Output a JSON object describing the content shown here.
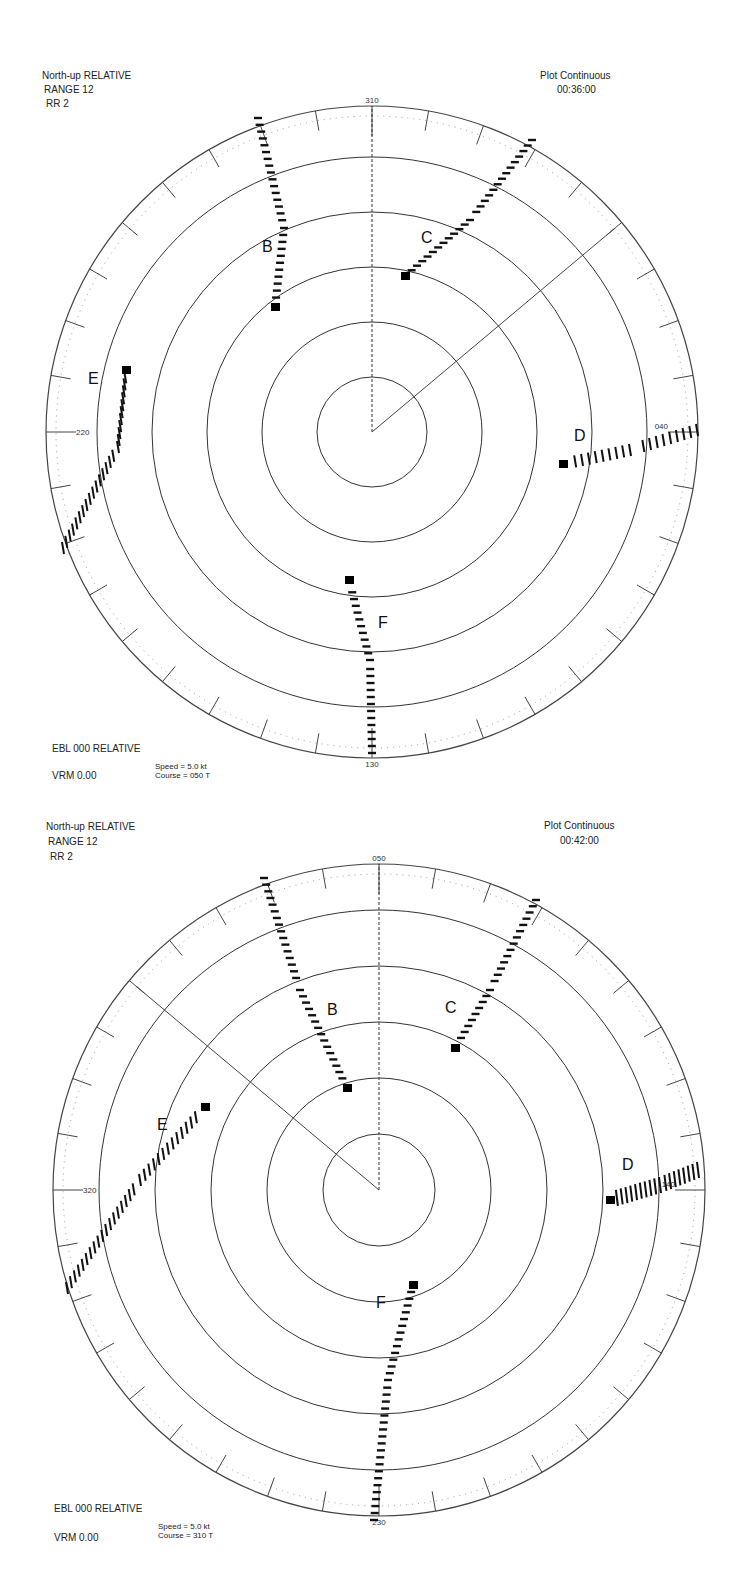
{
  "plots": [
    {
      "id": "plot-1",
      "top": 0,
      "center": [
        372,
        432
      ],
      "radius": 326,
      "ring_spacing": 55,
      "ring_count": 5,
      "header": {
        "mode": "North-up RELATIVE",
        "range": "RANGE  12",
        "rr": "RR  2",
        "plot_mode": "Plot Continuous",
        "time": "00:36:00"
      },
      "footer": {
        "ebl": "EBL 000 RELATIVE",
        "vrm": "VRM 0.00",
        "speed": "Speed = 5.0 kt",
        "course": "Course = 050 T"
      },
      "bearing_labels": {
        "top": "310",
        "bottom": "130",
        "left": "220",
        "right": "040"
      },
      "heading_line_deg": 50,
      "targets": [
        {
          "label": "B",
          "label_pos": [
            262,
            252
          ],
          "track": [
            [
              258,
              118
            ],
            [
              284,
              228
            ],
            [
              275,
              307
            ]
          ],
          "marker": [
            275,
            307
          ],
          "style": "dash"
        },
        {
          "label": "C",
          "label_pos": [
            421,
            243
          ],
          "track": [
            [
              532,
              140
            ],
            [
              470,
              220
            ],
            [
              405,
              276
            ]
          ],
          "marker": [
            405,
            276
          ],
          "style": "dash"
        },
        {
          "label": "D",
          "label_pos": [
            574,
            441
          ],
          "track": [
            [
              697,
              430
            ],
            [
              630,
              450
            ],
            [
              563,
              464
            ]
          ],
          "marker": [
            563,
            464
          ],
          "style": "dash-v"
        },
        {
          "label": "E",
          "label_pos": [
            88,
            384
          ],
          "track": [
            [
              63,
              548
            ],
            [
              118,
              447
            ],
            [
              126,
              370
            ]
          ],
          "marker": [
            126,
            370
          ],
          "style": "dash-v"
        },
        {
          "label": "F",
          "label_pos": [
            378,
            628
          ],
          "track": [
            [
              372,
              753
            ],
            [
              370,
              660
            ],
            [
              349,
              580
            ]
          ],
          "marker": [
            349,
            580
          ],
          "style": "dash"
        }
      ]
    },
    {
      "id": "plot-2",
      "top": 0,
      "center": [
        379,
        1190
      ],
      "radius": 326,
      "ring_spacing": 56,
      "ring_count": 5,
      "header": {
        "mode": "North-up RELATIVE",
        "range": "RANGE  12",
        "rr": "RR  2",
        "plot_mode": "Plot Continuous",
        "time": "00:42:00"
      },
      "footer": {
        "ebl": "EBL 000 RELATIVE",
        "vrm": "VRM 0.00",
        "speed": "Speed = 5.0 kt",
        "course": "Course = 310 T"
      },
      "bearing_labels": {
        "top": "050",
        "bottom": "230",
        "left": "320",
        "right": "140"
      },
      "heading_line_deg": 310,
      "targets": [
        {
          "label": "B",
          "label_pos": [
            327,
            1015
          ],
          "track": [
            [
              264,
              878
            ],
            [
              300,
              990
            ],
            [
              347,
              1088
            ]
          ],
          "marker": [
            347,
            1088
          ],
          "style": "dash"
        },
        {
          "label": "C",
          "label_pos": [
            445,
            1013
          ],
          "track": [
            [
              536,
              900
            ],
            [
              490,
              990
            ],
            [
              455,
              1048
            ]
          ],
          "marker": [
            455,
            1048
          ],
          "style": "dash"
        },
        {
          "label": "D",
          "label_pos": [
            622,
            1170
          ],
          "track": [
            [
              698,
              1170
            ],
            [
              660,
              1185
            ],
            [
              610,
              1200
            ]
          ],
          "marker": [
            610,
            1200
          ],
          "style": "dash-v-heavy"
        },
        {
          "label": "E",
          "label_pos": [
            157,
            1130
          ],
          "track": [
            [
              67,
              1288
            ],
            [
              140,
              1180
            ],
            [
              205,
              1107
            ]
          ],
          "marker": [
            205,
            1107
          ],
          "style": "dash-v"
        },
        {
          "label": "F",
          "label_pos": [
            376,
            1308
          ],
          "track": [
            [
              374,
              1520
            ],
            [
              388,
              1380
            ],
            [
              413,
              1285
            ]
          ],
          "marker": [
            413,
            1285
          ],
          "style": "dash"
        }
      ]
    }
  ]
}
